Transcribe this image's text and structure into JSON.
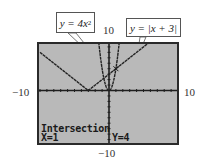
{
  "window": {
    "xmin": -10,
    "xmax": 10,
    "ymin": -10,
    "ymax": 10
  },
  "axis_labels": {
    "top": "10",
    "left": "−10",
    "right": "10",
    "bottom": "−10"
  },
  "callouts": [
    {
      "id": "parabola",
      "prefix": "y = 4x",
      "superscript": "2",
      "text": "y = 4x²"
    },
    {
      "id": "absolute",
      "text": "y = |x + 3|"
    }
  ],
  "screen": {
    "background": "#b9b9b9",
    "border": "#2a2a2a",
    "status_title": "Intersection",
    "x_readout": "X=1",
    "y_readout": "Y=4"
  },
  "functions": [
    {
      "name": "y1",
      "expr": "4x^2",
      "color": "#2a2a2a"
    },
    {
      "name": "y2",
      "expr": "|x+3|",
      "color": "#2a2a2a"
    }
  ],
  "intersection": {
    "x": 1,
    "y": 4
  }
}
